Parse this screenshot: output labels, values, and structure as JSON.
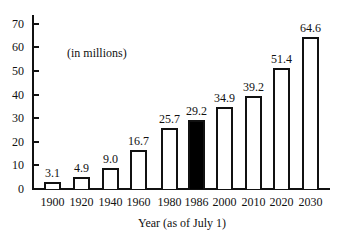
{
  "chart_data": {
    "type": "bar",
    "title": "",
    "annotation": "(in millions)",
    "xlabel": "Year (as of July 1)",
    "ylabel": "",
    "ylim": [
      0,
      70
    ],
    "yticks": [
      0,
      10,
      20,
      30,
      40,
      50,
      60,
      70
    ],
    "grid": false,
    "legend": null,
    "categories": [
      "1900",
      "1920",
      "1940",
      "1960",
      "1980",
      "1986",
      "2000",
      "2010",
      "2020",
      "2030"
    ],
    "values": [
      3.1,
      4.9,
      9.0,
      16.7,
      25.7,
      29.2,
      34.9,
      39.2,
      51.4,
      64.6
    ],
    "value_labels": [
      "3.1",
      "4.9",
      "9.0",
      "16.7",
      "25.7",
      "29.2",
      "34.9",
      "39.2",
      "51.4",
      "64.6"
    ],
    "highlighted_category": "1986",
    "colors": {
      "bar_fill": "#ffffff",
      "bar_outline": "#111111",
      "highlight_fill": "#000000"
    }
  }
}
